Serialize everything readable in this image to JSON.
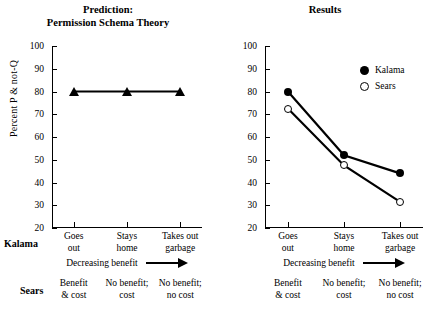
{
  "chart_data": [
    {
      "type": "line",
      "panel": "left",
      "title": "Prediction:\nPermission Schema Theory",
      "title_line1": "Prediction:",
      "title_line2": "Permission Schema Theory",
      "xlabel": "",
      "ylabel": "Percent P & not-Q",
      "ylim": [
        20,
        100
      ],
      "yticks": [
        100,
        90,
        80,
        70,
        60,
        50,
        40,
        30,
        20
      ],
      "grid": false,
      "categories": [
        "Goes out",
        "Stays home",
        "Takes out garbage"
      ],
      "category_lines": [
        [
          "Goes",
          "out"
        ],
        [
          "Stays",
          "home"
        ],
        [
          "Takes out",
          "garbage"
        ]
      ],
      "series": [
        {
          "name": "Prediction",
          "marker": "triangle-filled",
          "values": [
            80,
            80,
            80
          ]
        }
      ]
    },
    {
      "type": "line",
      "panel": "right",
      "title": "Results",
      "xlabel": "",
      "ylabel": "",
      "ylim": [
        20,
        100
      ],
      "yticks": [
        100,
        90,
        80,
        70,
        60,
        50,
        40,
        30,
        20
      ],
      "grid": false,
      "legend_position": "upper right",
      "categories": [
        "Goes out",
        "Stays home",
        "Takes out garbage"
      ],
      "category_lines": [
        [
          "Goes",
          "out"
        ],
        [
          "Stays",
          "home"
        ],
        [
          "Takes out",
          "garbage"
        ]
      ],
      "series": [
        {
          "name": "Kalama",
          "marker": "circle-filled",
          "values": [
            80,
            52,
            44
          ]
        },
        {
          "name": "Sears",
          "marker": "circle-open",
          "values": [
            72.5,
            47.5,
            31.5
          ]
        }
      ]
    }
  ],
  "titles": {
    "left_line1": "Prediction:",
    "left_line2": "Permission Schema Theory",
    "right": "Results"
  },
  "axis": {
    "ylabel": "Percent P & not-Q",
    "yticks": [
      "100",
      "90",
      "80",
      "70",
      "60",
      "50",
      "40",
      "30",
      "20"
    ]
  },
  "legend": {
    "kalama": "Kalama",
    "sears": "Sears"
  },
  "rows": {
    "kalama_label": "Kalama",
    "sears_label": "Sears",
    "benefit_text": "Decreasing benefit"
  },
  "kalama_categories": [
    {
      "line1": "Goes",
      "line2": "out"
    },
    {
      "line1": "Stays",
      "line2": "home"
    },
    {
      "line1": "Takes out",
      "line2": "garbage"
    }
  ],
  "sears_categories": [
    {
      "line1": "Benefit",
      "line2": "& cost"
    },
    {
      "line1": "No benefit;",
      "line2": "cost"
    },
    {
      "line1": "No benefit;",
      "line2": "no cost"
    }
  ],
  "colors": {
    "ink": "#000000",
    "background": "#ffffff"
  }
}
